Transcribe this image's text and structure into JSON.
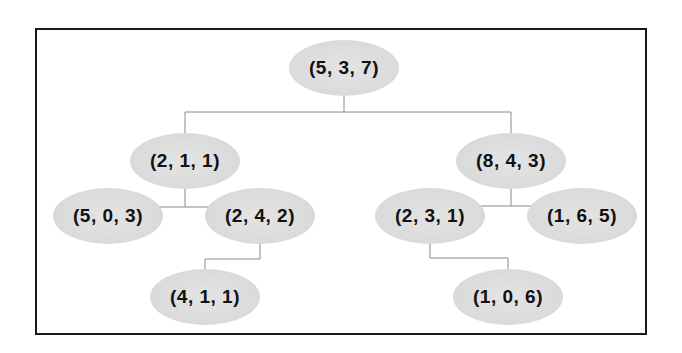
{
  "diagram": {
    "type": "tree",
    "nodes": [
      {
        "id": "root",
        "label": "(5, 3, 7)",
        "x": 344,
        "y": 68
      },
      {
        "id": "l",
        "label": "(2, 1, 1)",
        "x": 185,
        "y": 161
      },
      {
        "id": "r",
        "label": "(8, 4, 3)",
        "x": 511,
        "y": 161
      },
      {
        "id": "ll",
        "label": "(5, 0, 3)",
        "x": 108,
        "y": 216
      },
      {
        "id": "lr",
        "label": "(2, 4, 2)",
        "x": 260,
        "y": 216
      },
      {
        "id": "rl",
        "label": "(2, 3, 1)",
        "x": 430,
        "y": 216
      },
      {
        "id": "rr",
        "label": "(1, 6, 5)",
        "x": 582,
        "y": 216
      },
      {
        "id": "lrl",
        "label": "(4, 1, 1)",
        "x": 205,
        "y": 297
      },
      {
        "id": "rlr",
        "label": "(1, 0, 6)",
        "x": 508,
        "y": 297
      }
    ],
    "edges": [
      [
        "root",
        "l"
      ],
      [
        "root",
        "r"
      ],
      [
        "l",
        "ll"
      ],
      [
        "l",
        "lr"
      ],
      [
        "r",
        "rl"
      ],
      [
        "r",
        "rr"
      ],
      [
        "lr",
        "lrl"
      ],
      [
        "rl",
        "rlr"
      ]
    ]
  }
}
